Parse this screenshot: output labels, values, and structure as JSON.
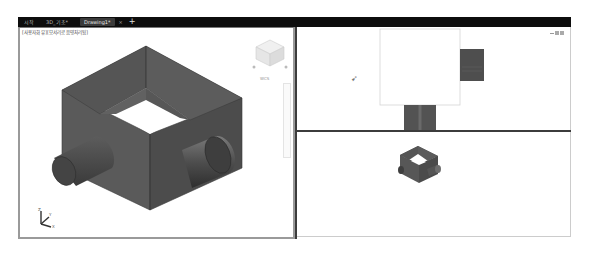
{
  "tabs": [
    {
      "label": "시작",
      "active": false
    },
    {
      "label": "3D_기초*",
      "active": false
    },
    {
      "label": "Drawing1*",
      "active": true
    }
  ],
  "tab_close_glyph": "×",
  "tab_add_glyph": "+",
  "viewports": {
    "left": {
      "label": "[사용자화 뷰][모서리로 음영처리됨]",
      "view": "isometric",
      "viewcube_label": "WCS",
      "axis_labels": {
        "x": "X",
        "y": "Y",
        "z": "Z"
      }
    },
    "top_right": {
      "view": "top",
      "window_controls": [
        "minimize",
        "restore",
        "close"
      ]
    },
    "bottom_right": {
      "view": "isometric-small"
    }
  },
  "colors": {
    "tabbar_bg": "#0d0d0d",
    "divider": "#3c3c3c",
    "model_dark": "#4a4a4a",
    "model_mid": "#5e5e5e",
    "model_light": "#6e6e6e"
  }
}
